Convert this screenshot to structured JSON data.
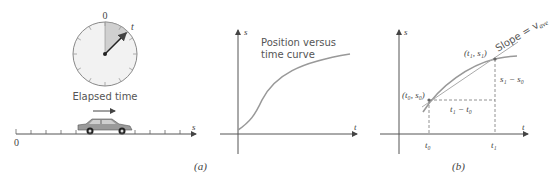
{
  "panel_a": {
    "clock": {
      "top_label": "0",
      "hand_label": "t",
      "caption": "Elapsed time"
    },
    "number_line": {
      "origin_label": "0",
      "axis_label": "s"
    },
    "graph": {
      "x_label": "t",
      "y_label": "s",
      "curve_label_line1": "Position versus",
      "curve_label_line2": "time curve"
    },
    "caption": "(a)"
  },
  "panel_b": {
    "x_label": "t",
    "y_label": "s",
    "point0": "(t₀, s₀)",
    "point1": "(t₁, s₁)",
    "slope_label": "Slope = v",
    "slope_sub": "ave",
    "dt_label": "t₁ − t₀",
    "ds_label": "s₁ − s₀",
    "tick0": "t₀",
    "tick1": "t₁",
    "caption": "(b)"
  },
  "colors": {
    "curve": "#999999",
    "axis": "#555555",
    "shade": "#d0d0d0",
    "clock_face": "#f2f2f2"
  }
}
